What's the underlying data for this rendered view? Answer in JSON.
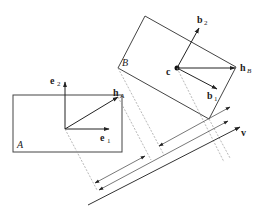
{
  "diagram": {
    "type": "separating-axis projection diagram",
    "box_a": {
      "label": "A",
      "axes": [
        {
          "name": "e",
          "sub": "1"
        },
        {
          "name": "e",
          "sub": "2"
        }
      ],
      "half_vector": {
        "name": "h",
        "sub": "A"
      }
    },
    "box_b": {
      "label": "B",
      "center": "c",
      "axes": [
        {
          "name": "b",
          "sub": "1"
        },
        {
          "name": "b",
          "sub": "2"
        }
      ],
      "half_vector": {
        "name": "h",
        "sub": "B"
      }
    },
    "axis": {
      "name": "v"
    },
    "colors": {
      "stroke": "#333333",
      "dashed": "#888888",
      "background": "#ffffff"
    }
  }
}
